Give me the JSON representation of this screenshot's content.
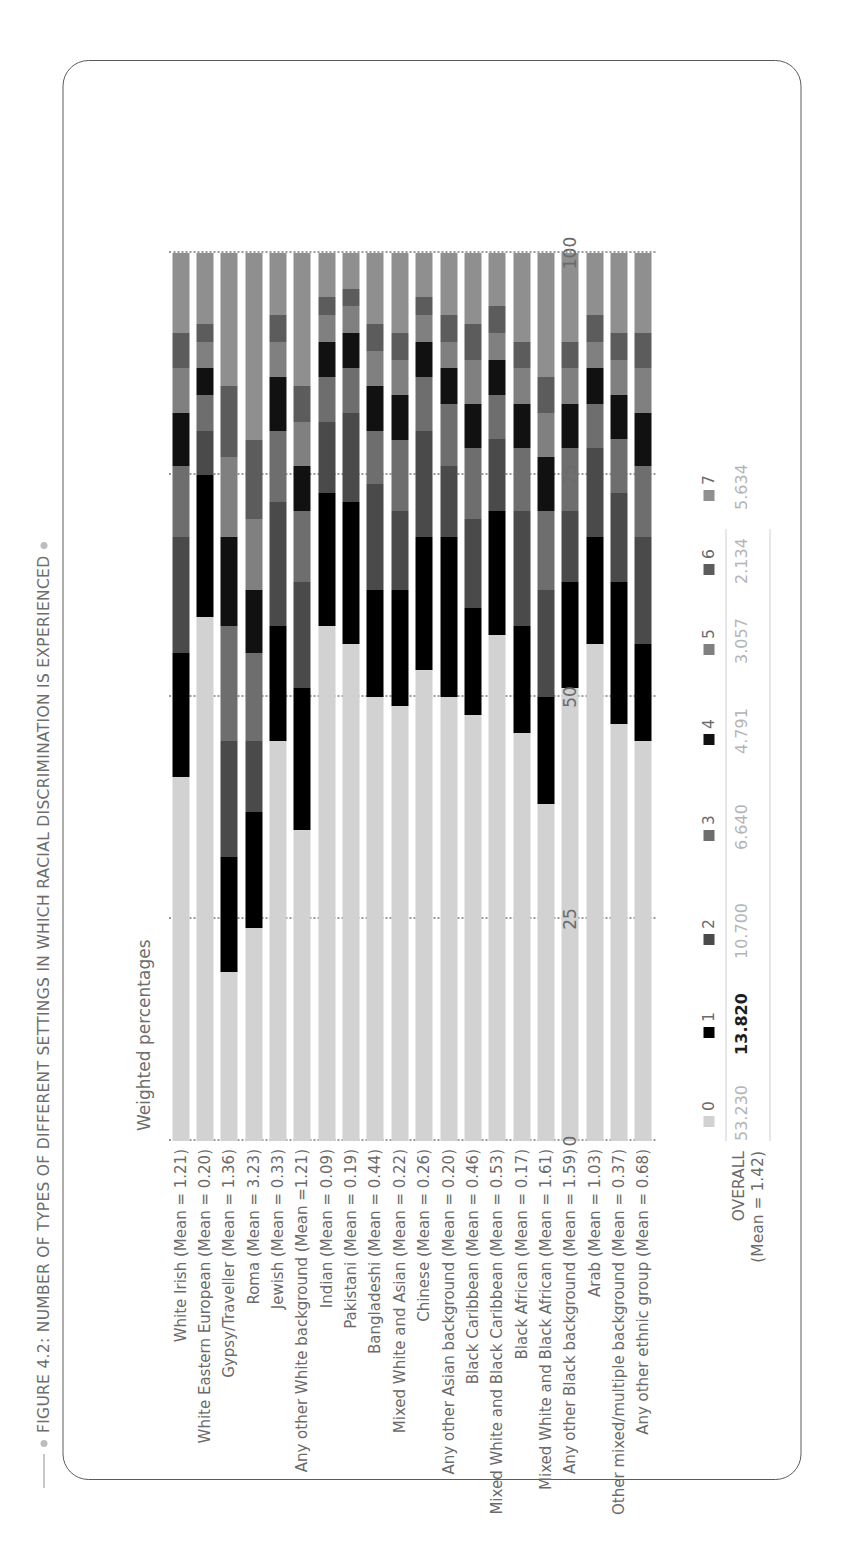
{
  "figure": {
    "title": "FIGURE 4.2: NUMBER OF TYPES OF DIFFERENT SETTINGS IN WHICH RACIAL DISCRIMINATION IS EXPERIENCED",
    "axis_label": "Weighted percentages",
    "overall_label": "OVERALL",
    "overall_mean": "(Mean = 1.42)"
  },
  "chart_data": {
    "type": "bar",
    "orientation": "horizontal",
    "stacked": true,
    "title": "FIGURE 4.2: NUMBER OF TYPES OF DIFFERENT SETTINGS IN WHICH RACIAL DISCRIMINATION IS EXPERIENCED",
    "xlabel": "Weighted percentages",
    "ylabel": "",
    "xlim": [
      0,
      100
    ],
    "xticks": [
      "0",
      "25",
      "50",
      "75",
      "100"
    ],
    "grid": true,
    "legend_position": "bottom",
    "legend_entries": [
      "0",
      "1",
      "2",
      "3",
      "4",
      "5",
      "6",
      "7"
    ],
    "colors": [
      "#d2d2d2",
      "#000000",
      "#4a4a4a",
      "#6e6e6e",
      "#111111",
      "#808080",
      "#5c5c5c",
      "#8f8f8f"
    ],
    "overall_values": [
      "53.230",
      "13.820",
      "10.700",
      "6.640",
      "4.791",
      "3.057",
      "2.134",
      "5.634"
    ],
    "categories": [
      "White Irish (Mean = 1.21)",
      "White Eastern European (Mean = 0.20)",
      "Gypsy/Traveller (Mean = 1.36)",
      "Roma (Mean = 3.23)",
      "Jewish (Mean = 0.33)",
      "Any other White background (Mean =1.21)",
      "Indian (Mean = 0.09)",
      "Pakistani (Mean = 0.19)",
      "Bangladeshi (Mean = 0.44)",
      "Mixed White and Asian (Mean = 0.22)",
      "Chinese (Mean = 0.26)",
      "Any other Asian background (Mean = 0.20)",
      "Black Caribbean (Mean = 0.46)",
      "Mixed White and Black Caribbean (Mean = 0.53)",
      "Black African (Mean = 0.17)",
      "Mixed White and Black African (Mean = 1.61)",
      "Any other Black background (Mean = 1.59)",
      "Arab (Mean = 1.03)",
      "Other mixed/multiple background (Mean = 0.37)",
      "Any other ethnic group (Mean = 0.68)"
    ],
    "series": [
      {
        "name": "0",
        "values": [
          41,
          59,
          19,
          24,
          45,
          35,
          58,
          56,
          50,
          49,
          53,
          50,
          48,
          57,
          46,
          38,
          51,
          56,
          47,
          45
        ]
      },
      {
        "name": "1",
        "values": [
          14,
          16,
          13,
          13,
          13,
          16,
          15,
          16,
          12,
          13,
          15,
          18,
          12,
          14,
          12,
          12,
          12,
          12,
          16,
          11
        ]
      },
      {
        "name": "2",
        "values": [
          13,
          5,
          13,
          8,
          14,
          12,
          8,
          10,
          12,
          9,
          12,
          8,
          10,
          8,
          13,
          12,
          8,
          10,
          10,
          12
        ]
      },
      {
        "name": "3",
        "values": [
          8,
          4,
          13,
          10,
          8,
          8,
          5,
          5,
          6,
          8,
          6,
          7,
          8,
          5,
          7,
          9,
          7,
          5,
          6,
          8
        ]
      },
      {
        "name": "4",
        "values": [
          6,
          3,
          10,
          7,
          6,
          5,
          4,
          4,
          5,
          5,
          4,
          4,
          5,
          4,
          5,
          6,
          5,
          4,
          5,
          6
        ]
      },
      {
        "name": "5",
        "values": [
          5,
          3,
          9,
          8,
          4,
          5,
          3,
          3,
          4,
          4,
          3,
          3,
          5,
          3,
          4,
          5,
          4,
          3,
          4,
          5
        ]
      },
      {
        "name": "6",
        "values": [
          4,
          2,
          8,
          9,
          3,
          4,
          2,
          2,
          3,
          3,
          2,
          3,
          4,
          3,
          3,
          4,
          3,
          3,
          3,
          4
        ]
      },
      {
        "name": "7",
        "values": [
          9,
          8,
          15,
          21,
          7,
          15,
          5,
          4,
          8,
          9,
          5,
          7,
          8,
          6,
          10,
          14,
          10,
          7,
          9,
          9
        ]
      }
    ]
  }
}
